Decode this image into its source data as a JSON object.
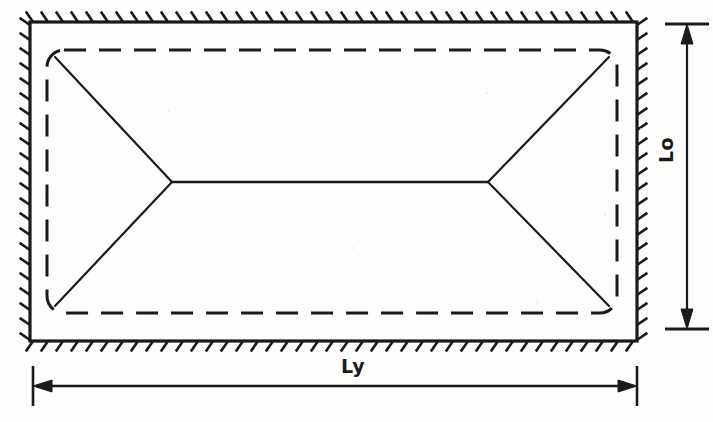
{
  "figure": {
    "background_color": "#fdfdfb",
    "ink_color": "#1a1a1a"
  },
  "labels": {
    "horizontal_dimension": "Ly",
    "vertical_dimension": "Lo"
  },
  "geometry": {
    "outer_boundary": {
      "name": "slab-support-boundary",
      "x": 30,
      "y": 22,
      "width": 607,
      "height": 319,
      "stroke_width": 3.2
    },
    "hatching": {
      "name": "fixed-support-hatching",
      "tick_length": 13,
      "spacing": 15,
      "angle_deg": 55,
      "description": "hatch ticks outside all four edges denoting fixed support"
    },
    "inner_dashed_boundary": {
      "name": "negative-yield-line",
      "x": 47,
      "y": 50,
      "width": 570,
      "height": 263,
      "corner_radius": 17,
      "dash_pattern": "22 13",
      "stroke_width": 3.0
    },
    "yield_lines": {
      "name": "positive-yield-lines",
      "left_vertex": {
        "x": 172,
        "y": 182
      },
      "right_vertex": {
        "x": 488,
        "y": 182
      },
      "corners": [
        {
          "x": 55,
          "y": 57
        },
        {
          "x": 609,
          "y": 57
        },
        {
          "x": 609,
          "y": 306
        },
        {
          "x": 55,
          "y": 306
        }
      ],
      "ridge_line": {
        "x1": 172,
        "y1": 182,
        "x2": 488,
        "y2": 182
      },
      "stroke_width": 2.2
    },
    "dimension_horizontal": {
      "name": "ly-dimension-line",
      "y": 386,
      "x1": 33,
      "x2": 637,
      "extension_top": 366,
      "extension_bottom": 406,
      "stroke_width": 2.4
    },
    "dimension_vertical": {
      "name": "lo-dimension-line",
      "x": 687,
      "y1": 24,
      "y2": 329,
      "extension_left": 665,
      "extension_right": 709,
      "stroke_width": 2.4
    }
  }
}
